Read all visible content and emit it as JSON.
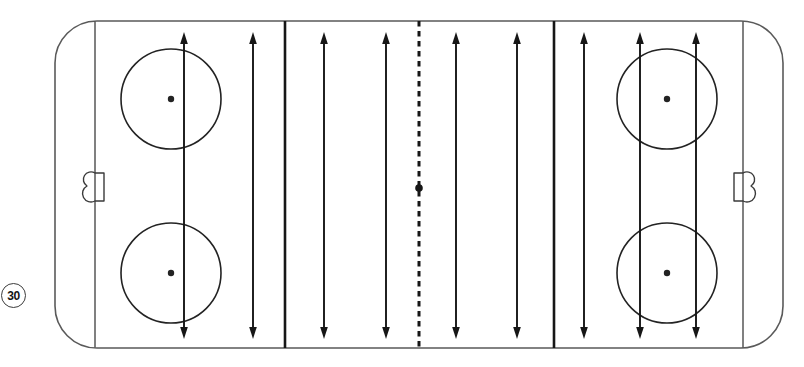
{
  "page": {
    "background_color": "#ffffff"
  },
  "drill": {
    "number": "30"
  },
  "rink": {
    "canvas": {
      "width": 804,
      "height": 367
    },
    "outline": {
      "x": 55,
      "y": 21,
      "width": 728,
      "height": 327,
      "corner_radius": 42,
      "color": "#5a5a5a",
      "stroke_width": 1.6
    },
    "goal_lines": {
      "x_positions": [
        95,
        743
      ],
      "y_top": 21,
      "y_bottom": 348,
      "color": "#4a4a4a",
      "stroke_width": 1.4
    },
    "blue_lines": {
      "x_positions": [
        285,
        554
      ],
      "y_top": 21,
      "y_bottom": 348,
      "color": "#161616",
      "stroke_width": 2.6
    },
    "center_line": {
      "x": 419,
      "y_top": 21,
      "y_bottom": 348,
      "color": "#161616",
      "stroke_width": 3,
      "dash_pattern": "5.5 4.5",
      "dot": {
        "y": 188,
        "radius": 3.8
      }
    },
    "faceoff_circles": {
      "radius": 50,
      "dot_radius": 3.2,
      "color": "#232323",
      "stroke_width": 1.6,
      "centers": [
        {
          "cx": 171,
          "cy": 99
        },
        {
          "cx": 171,
          "cy": 273
        },
        {
          "cx": 667,
          "cy": 99
        },
        {
          "cx": 667,
          "cy": 273
        }
      ]
    },
    "goals": {
      "color": "#3a3a3a",
      "stroke_width": 1.4,
      "half_height": 14,
      "front_depth": 9,
      "back_depth": 8,
      "items": [
        {
          "line_x": 95,
          "cy": 187,
          "back_toward": "left"
        },
        {
          "line_x": 743,
          "cy": 187,
          "back_toward": "right"
        }
      ]
    },
    "skating_arrows": {
      "description": "vertical double-headed arrows spanning the ice width-wise lanes",
      "color": "#161616",
      "stroke_width": 1.9,
      "x_positions": [
        184,
        253,
        324,
        386,
        456,
        517,
        584,
        640,
        696
      ],
      "y_top": 32,
      "y_bottom": 339,
      "head_length": 12,
      "head_half_width": 3.8,
      "double_headed": true
    }
  }
}
